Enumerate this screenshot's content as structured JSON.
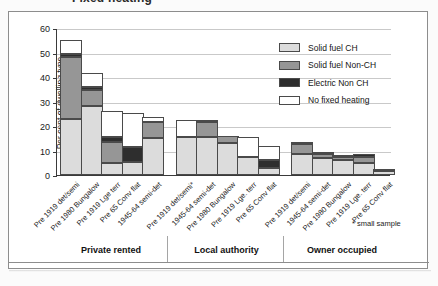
{
  "title": "Fixed heating",
  "axis": {
    "ylabel": "Per cent of dwelling type",
    "yticks": [
      "0",
      "10",
      "20",
      "30",
      "40",
      "50",
      "60"
    ]
  },
  "legend": {
    "items": [
      {
        "label": "Solid fuel CH",
        "color": "#dcdcdc"
      },
      {
        "label": "Solid fuel Non-CH",
        "color": "#969696"
      },
      {
        "label": "Electric Non CH",
        "color": "#2e2e2e"
      },
      {
        "label": "No fixed heating",
        "color": "#ffffff"
      }
    ]
  },
  "footnote": "* small sample",
  "groups": [
    {
      "label": "Private rented"
    },
    {
      "label": "Local authority"
    },
    {
      "label": "Owner occupied"
    }
  ],
  "chart_data": {
    "type": "bar",
    "subtype": "stacked",
    "title": "Fixed heating",
    "xlabel": "",
    "ylabel": "Per cent of dwelling type",
    "ylim": [
      0,
      60
    ],
    "ytick_step": 10,
    "grid": true,
    "legend_position": "top-right",
    "series": [
      {
        "name": "Solid fuel CH",
        "color": "#dcdcdc",
        "values": [
          23,
          28,
          5,
          5.5,
          15,
          15.5,
          15.5,
          13,
          7.5,
          3,
          8.5,
          7,
          6,
          5,
          1.5
        ]
      },
      {
        "name": "Solid fuel Non-CH",
        "color": "#969696",
        "values": [
          25,
          6.5,
          8.5,
          0,
          6.5,
          0,
          6,
          3,
          0,
          0,
          4,
          1.5,
          1.5,
          2.5,
          0
        ]
      },
      {
        "name": "Electric Non CH",
        "color": "#2e2e2e",
        "values": [
          1.5,
          1.5,
          2,
          6,
          0,
          0,
          1,
          0,
          0,
          3,
          1,
          0.5,
          0.5,
          1,
          0
        ]
      },
      {
        "name": "No fixed heating",
        "color": "#ffffff",
        "values": [
          5.5,
          5.5,
          10.8,
          13.8,
          2.3,
          7,
          0,
          0,
          8,
          6,
          0,
          0,
          0,
          0,
          1
        ]
      }
    ],
    "categories": [
      "Pre 1919 det/semi",
      "Pre 1980 Bungalow",
      "Pre 1919 Lge terr",
      "Pre 65 Conv flat",
      "1945-64 semi-det",
      "Pre 1919 det/semi*",
      "1945-64 semi-det",
      "Pre 1980 Bungalow",
      "Pre 1919 Lge. terr",
      "Pre 65 Conv flat",
      "Pre 1919 det/semi",
      "1945-64 semi-det",
      "Pre 1980 Bungalow",
      "Pre 1919 Lge. terr",
      "Pre 65 Conv flat"
    ],
    "totals": [
      55,
      41.5,
      26.3,
      25.3,
      23.8,
      22.5,
      22.5,
      16,
      15.5,
      12,
      13.5,
      9,
      8,
      8.5,
      2.5
    ],
    "group_of_bar": [
      0,
      0,
      0,
      0,
      0,
      1,
      1,
      1,
      1,
      1,
      2,
      2,
      2,
      2,
      2
    ]
  }
}
